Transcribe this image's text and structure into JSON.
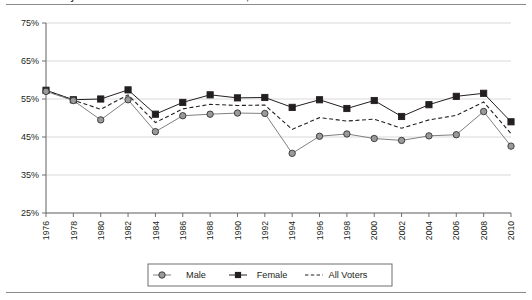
{
  "figure": {
    "title": "Voter Turnout by Sex in Presidential and Midterm Elections, 1976-2010",
    "top_rule": "horizontal-rule",
    "bottom_rule": "horizontal-rule"
  },
  "chart_data": {
    "type": "line",
    "title": "Voter Turnout by Sex in Presidential and Midterm Elections, 1976-2010",
    "xlabel": "",
    "ylabel": "",
    "ylim": [
      25,
      75
    ],
    "yticks": [
      25,
      35,
      45,
      55,
      65,
      75
    ],
    "ytick_labels": [
      "25%",
      "35%",
      "45%",
      "55%",
      "65%",
      "75%"
    ],
    "grid": true,
    "legend_position": "bottom",
    "categories": [
      "1976",
      "1978",
      "1980",
      "1982",
      "1984",
      "1986",
      "1988",
      "1990",
      "1992",
      "1994",
      "1996",
      "1998",
      "2000",
      "2002",
      "2004",
      "2006",
      "2008",
      "2010"
    ],
    "x": [
      1976,
      1978,
      1980,
      1982,
      1984,
      1986,
      1988,
      1990,
      1992,
      1994,
      1996,
      1998,
      2000,
      2002,
      2004,
      2006,
      2008,
      2010
    ],
    "series": [
      {
        "name": "Male",
        "marker": "circle",
        "color": "#808080",
        "line_style": "solid",
        "values": [
          57.0,
          54.6,
          49.5,
          54.8,
          46.4,
          50.6,
          51.0,
          51.3,
          51.2,
          40.7,
          45.2,
          45.8,
          44.6,
          44.1,
          45.3,
          45.6,
          51.7,
          42.6
        ]
      },
      {
        "name": "Female",
        "marker": "square",
        "color": "#231f20",
        "line_style": "solid",
        "values": [
          57.3,
          54.8,
          55.0,
          57.4,
          51.0,
          54.1,
          56.1,
          55.3,
          55.4,
          52.8,
          54.8,
          52.5,
          54.6,
          50.4,
          53.5,
          55.7,
          56.5,
          49.0
        ]
      },
      {
        "name": "All Voters",
        "marker": "none",
        "color": "#231f20",
        "line_style": "dashed",
        "values": [
          57.2,
          54.7,
          52.3,
          56.1,
          48.8,
          52.4,
          53.6,
          53.3,
          53.4,
          47.0,
          50.1,
          49.2,
          49.7,
          47.3,
          49.5,
          50.7,
          54.2,
          45.9
        ]
      }
    ]
  },
  "legend": {
    "items": [
      {
        "label": "Male",
        "marker": "circle",
        "style": "solid",
        "color": "#808080"
      },
      {
        "label": "Female",
        "marker": "square",
        "style": "solid",
        "color": "#231f20"
      },
      {
        "label": "All Voters",
        "marker": "none",
        "style": "dashed",
        "color": "#231f20"
      }
    ]
  }
}
